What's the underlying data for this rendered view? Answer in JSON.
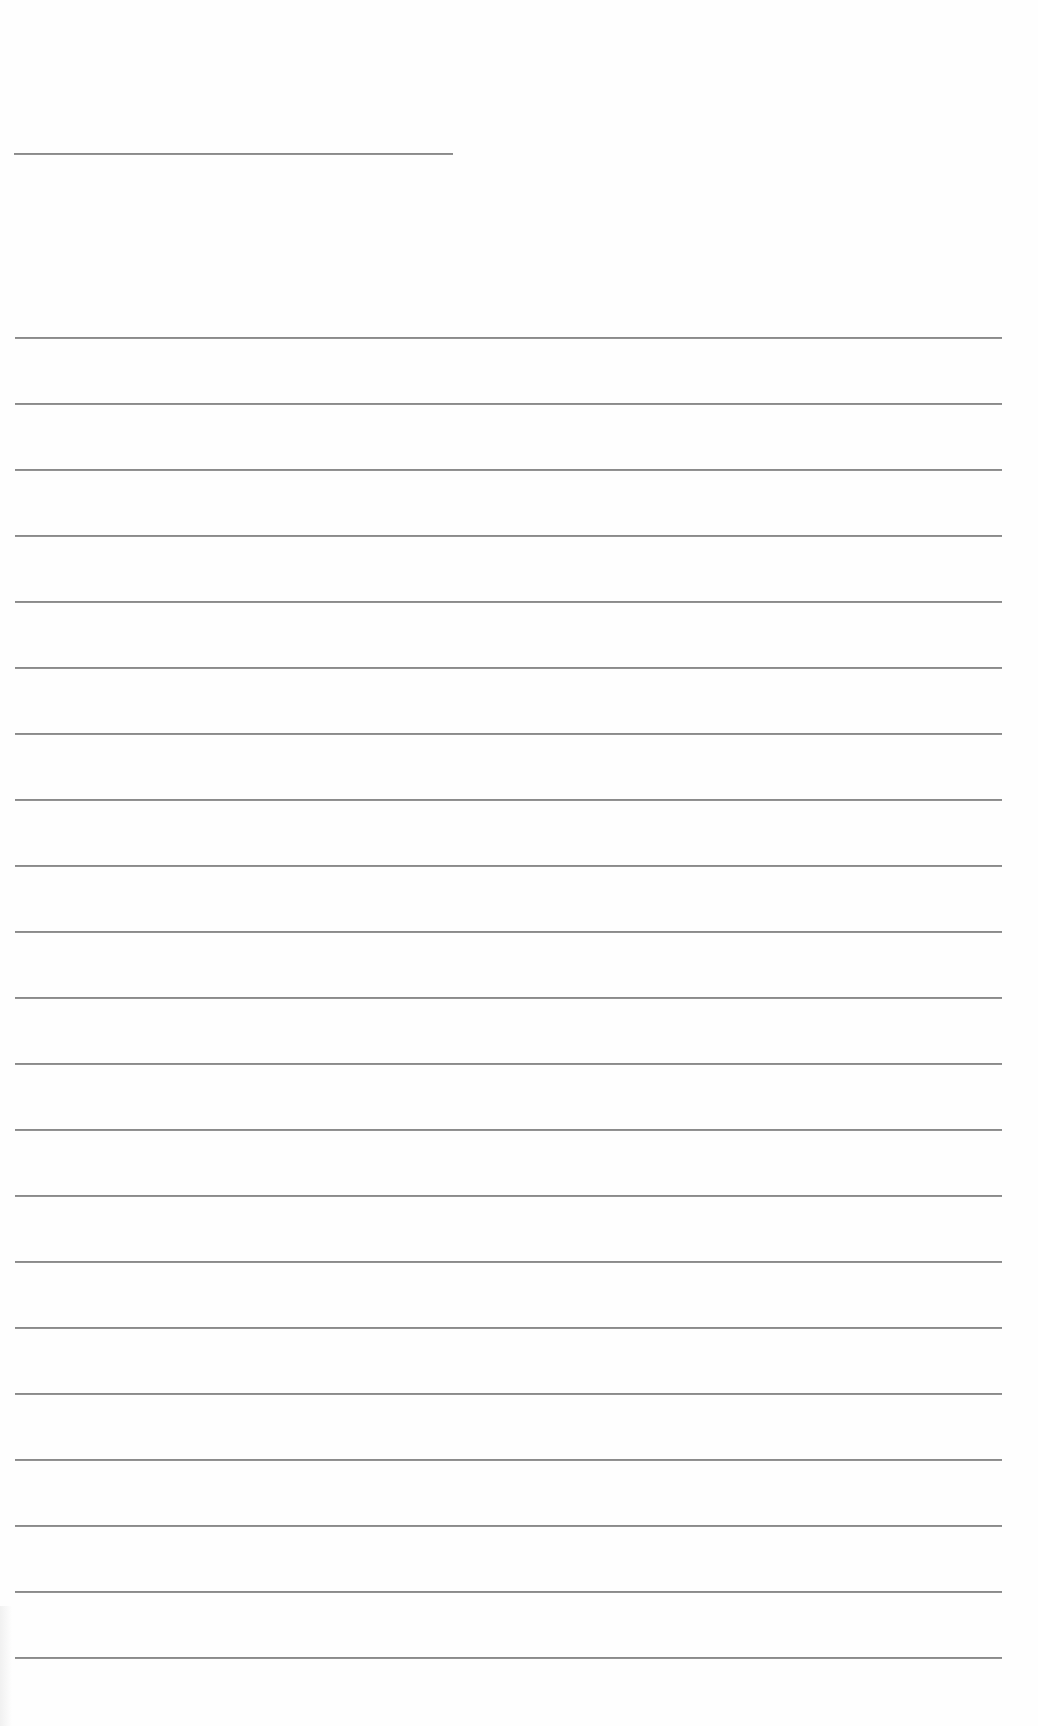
{
  "page": {
    "type": "blank-lined-paper",
    "background_color": "#fefefe",
    "rule_color": "#8a8a8a"
  },
  "header_rule": {
    "x_start": 14,
    "x_end": 453,
    "y": 153
  },
  "lines": {
    "x_start": 15,
    "x_end": 1002,
    "first_y": 337,
    "spacing": 66,
    "count": 21
  }
}
